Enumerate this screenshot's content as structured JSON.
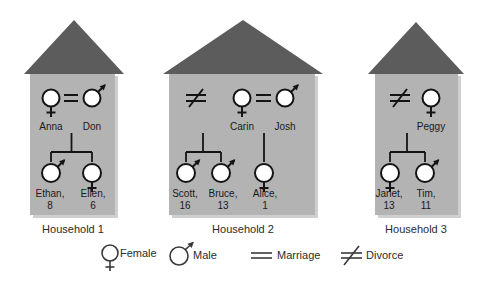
{
  "figure": {
    "colors": {
      "roof": "#5c5c5c",
      "house_body": "#b3b3b3",
      "house_shadow": "#cfcfcf",
      "symbol_stroke": "#141414",
      "symbol_fill": "#ffffff",
      "background": "#ffffff",
      "text": "#1a1a1a"
    }
  },
  "households": [
    {
      "id": "household-1",
      "label": "Household 1",
      "relationship": "marriage",
      "parents": [
        {
          "name": "Anna",
          "sex": "female",
          "age": ""
        },
        {
          "name": "Don",
          "sex": "male",
          "age": ""
        }
      ],
      "children": [
        {
          "name": "Ethan,",
          "age": "8",
          "sex": "male"
        },
        {
          "name": "Ellen,",
          "age": "6",
          "sex": "female"
        }
      ]
    },
    {
      "id": "household-2",
      "label": "Household 2",
      "relationship": "divorce_and_marriage",
      "parents": [
        {
          "name": "Carin",
          "sex": "female",
          "age": ""
        },
        {
          "name": "Josh",
          "sex": "male",
          "age": ""
        }
      ],
      "children": [
        {
          "name": "Scott,",
          "age": "16",
          "sex": "male"
        },
        {
          "name": "Bruce,",
          "age": "13",
          "sex": "male"
        },
        {
          "name": "Alice,",
          "age": "1",
          "sex": "female"
        }
      ]
    },
    {
      "id": "household-3",
      "label": "Household 3",
      "relationship": "divorce",
      "parents": [
        {
          "name": "Peggy",
          "sex": "female",
          "age": ""
        }
      ],
      "children": [
        {
          "name": "Janet,",
          "age": "13",
          "sex": "female"
        },
        {
          "name": "Tim,",
          "age": "11",
          "sex": "male"
        }
      ]
    }
  ],
  "legend": {
    "items": [
      {
        "key": "female",
        "label": "Female",
        "symbol": "female-symbol"
      },
      {
        "key": "male",
        "label": "Male",
        "symbol": "male-symbol"
      },
      {
        "key": "marriage",
        "label": "Marriage",
        "symbol": "marriage-symbol"
      },
      {
        "key": "divorce",
        "label": "Divorce",
        "symbol": "divorce-symbol"
      }
    ]
  }
}
